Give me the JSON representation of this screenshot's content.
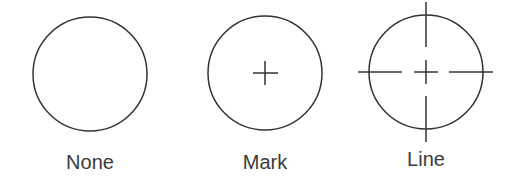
{
  "options": [
    {
      "id": "none",
      "label": "None",
      "style": "circle-only",
      "center": [
        90,
        74
      ],
      "radius": 57
    },
    {
      "id": "mark",
      "label": "Mark",
      "style": "circle-with-center-mark",
      "center": [
        265,
        73
      ],
      "radius": 57,
      "mark_half_size": 12
    },
    {
      "id": "line",
      "label": "Line",
      "style": "circle-with-center-mark-and-centerlines",
      "center": [
        426,
        72
      ],
      "radius": 57,
      "mark_half_size": 12
    }
  ],
  "colors": {
    "stroke": "#333333",
    "text": "#3a3a3a",
    "background": "#ffffff"
  }
}
